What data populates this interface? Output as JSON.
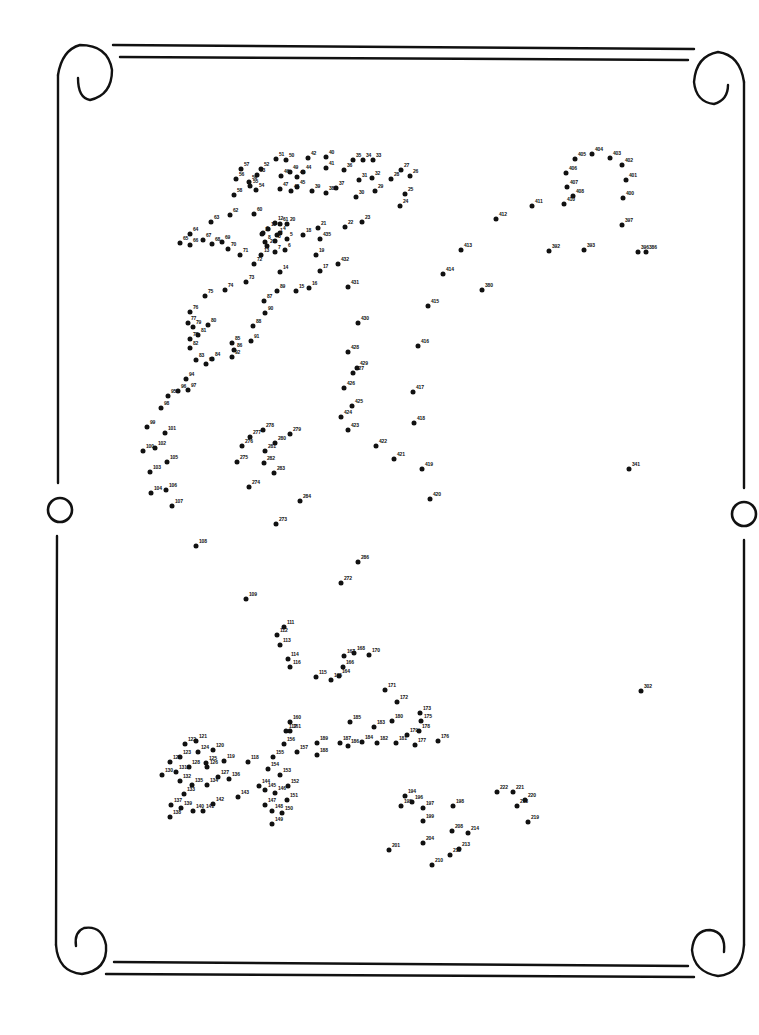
{
  "page": {
    "type": "connect-the-dots puzzle",
    "frame": "scroll border with curled corners and side rings",
    "max_number": 435,
    "ink_color": "#111111",
    "background_color": "#ffffff"
  },
  "dots": [
    {
      "n": "1",
      "x": 277,
      "y": 235
    },
    {
      "n": "2",
      "x": 267,
      "y": 246
    },
    {
      "n": "3",
      "x": 275,
      "y": 241
    },
    {
      "n": "4",
      "x": 280,
      "y": 233
    },
    {
      "n": "5",
      "x": 287,
      "y": 239
    },
    {
      "n": "6",
      "x": 285,
      "y": 250
    },
    {
      "n": "7",
      "x": 275,
      "y": 252
    },
    {
      "n": "8",
      "x": 265,
      "y": 242
    },
    {
      "n": "9",
      "x": 263,
      "y": 233
    },
    {
      "n": "10",
      "x": 262,
      "y": 234
    },
    {
      "n": "11",
      "x": 268,
      "y": 229
    },
    {
      "n": "12",
      "x": 275,
      "y": 223
    },
    {
      "n": "13",
      "x": 261,
      "y": 255
    },
    {
      "n": "14",
      "x": 280,
      "y": 272
    },
    {
      "n": "15",
      "x": 296,
      "y": 291
    },
    {
      "n": "16",
      "x": 309,
      "y": 288
    },
    {
      "n": "17",
      "x": 320,
      "y": 271
    },
    {
      "n": "18",
      "x": 303,
      "y": 235
    },
    {
      "n": "19",
      "x": 316,
      "y": 255
    },
    {
      "n": "20",
      "x": 287,
      "y": 224
    },
    {
      "n": "21",
      "x": 318,
      "y": 228
    },
    {
      "n": "22",
      "x": 345,
      "y": 227
    },
    {
      "n": "23",
      "x": 362,
      "y": 222
    },
    {
      "n": "24",
      "x": 400,
      "y": 206
    },
    {
      "n": "25",
      "x": 405,
      "y": 194
    },
    {
      "n": "26",
      "x": 410,
      "y": 176
    },
    {
      "n": "27",
      "x": 401,
      "y": 170
    },
    {
      "n": "28",
      "x": 391,
      "y": 179
    },
    {
      "n": "29",
      "x": 375,
      "y": 191
    },
    {
      "n": "30",
      "x": 356,
      "y": 197
    },
    {
      "n": "31",
      "x": 359,
      "y": 180
    },
    {
      "n": "32",
      "x": 372,
      "y": 178
    },
    {
      "n": "33",
      "x": 373,
      "y": 160
    },
    {
      "n": "34",
      "x": 363,
      "y": 160
    },
    {
      "n": "35",
      "x": 353,
      "y": 160
    },
    {
      "n": "36",
      "x": 344,
      "y": 170
    },
    {
      "n": "37",
      "x": 336,
      "y": 188
    },
    {
      "n": "38",
      "x": 326,
      "y": 193
    },
    {
      "n": "39",
      "x": 312,
      "y": 191
    },
    {
      "n": "40",
      "x": 326,
      "y": 157
    },
    {
      "n": "41",
      "x": 326,
      "y": 168
    },
    {
      "n": "42",
      "x": 308,
      "y": 158
    },
    {
      "n": "43",
      "x": 297,
      "y": 177
    },
    {
      "n": "44",
      "x": 303,
      "y": 172
    },
    {
      "n": "45",
      "x": 297,
      "y": 187
    },
    {
      "n": "46",
      "x": 281,
      "y": 176
    },
    {
      "n": "47",
      "x": 280,
      "y": 189
    },
    {
      "n": "48",
      "x": 291,
      "y": 191
    },
    {
      "n": "49",
      "x": 290,
      "y": 172
    },
    {
      "n": "50",
      "x": 286,
      "y": 160
    },
    {
      "n": "51",
      "x": 276,
      "y": 159
    },
    {
      "n": "52",
      "x": 261,
      "y": 169
    },
    {
      "n": "53",
      "x": 257,
      "y": 175
    },
    {
      "n": "54",
      "x": 256,
      "y": 190
    },
    {
      "n": "55",
      "x": 250,
      "y": 186
    },
    {
      "n": "56",
      "x": 236,
      "y": 179
    },
    {
      "n": "57",
      "x": 241,
      "y": 169
    },
    {
      "n": "58",
      "x": 234,
      "y": 195
    },
    {
      "n": "59",
      "x": 249,
      "y": 182
    },
    {
      "n": "60",
      "x": 254,
      "y": 214
    },
    {
      "n": "61",
      "x": 280,
      "y": 224
    },
    {
      "n": "62",
      "x": 230,
      "y": 215
    },
    {
      "n": "63",
      "x": 211,
      "y": 222
    },
    {
      "n": "64",
      "x": 190,
      "y": 234
    },
    {
      "n": "65",
      "x": 180,
      "y": 243
    },
    {
      "n": "66",
      "x": 190,
      "y": 245
    },
    {
      "n": "67",
      "x": 203,
      "y": 240
    },
    {
      "n": "68",
      "x": 212,
      "y": 244
    },
    {
      "n": "69",
      "x": 222,
      "y": 242
    },
    {
      "n": "70",
      "x": 228,
      "y": 249
    },
    {
      "n": "71",
      "x": 240,
      "y": 255
    },
    {
      "n": "72",
      "x": 254,
      "y": 264
    },
    {
      "n": "73",
      "x": 246,
      "y": 282
    },
    {
      "n": "74",
      "x": 225,
      "y": 290
    },
    {
      "n": "75",
      "x": 205,
      "y": 296
    },
    {
      "n": "76",
      "x": 190,
      "y": 312
    },
    {
      "n": "77",
      "x": 188,
      "y": 323
    },
    {
      "n": "78",
      "x": 190,
      "y": 339
    },
    {
      "n": "79",
      "x": 193,
      "y": 327
    },
    {
      "n": "80",
      "x": 208,
      "y": 325
    },
    {
      "n": "81",
      "x": 198,
      "y": 335
    },
    {
      "n": "82",
      "x": 190,
      "y": 348
    },
    {
      "n": "83",
      "x": 196,
      "y": 360
    },
    {
      "n": "84",
      "x": 212,
      "y": 359
    },
    {
      "n": "85",
      "x": 232,
      "y": 343
    },
    {
      "n": "86",
      "x": 234,
      "y": 350
    },
    {
      "n": "87",
      "x": 264,
      "y": 301
    },
    {
      "n": "88",
      "x": 253,
      "y": 326
    },
    {
      "n": "89",
      "x": 277,
      "y": 291
    },
    {
      "n": "90",
      "x": 265,
      "y": 313
    },
    {
      "n": "91",
      "x": 251,
      "y": 341
    },
    {
      "n": "92",
      "x": 232,
      "y": 357
    },
    {
      "n": "93",
      "x": 206,
      "y": 364
    },
    {
      "n": "94",
      "x": 186,
      "y": 379
    },
    {
      "n": "95",
      "x": 168,
      "y": 396
    },
    {
      "n": "96",
      "x": 178,
      "y": 391
    },
    {
      "n": "97",
      "x": 188,
      "y": 390
    },
    {
      "n": "98",
      "x": 161,
      "y": 408
    },
    {
      "n": "99",
      "x": 147,
      "y": 427
    },
    {
      "n": "100",
      "x": 143,
      "y": 451
    },
    {
      "n": "101",
      "x": 165,
      "y": 433
    },
    {
      "n": "102",
      "x": 155,
      "y": 448
    },
    {
      "n": "103",
      "x": 150,
      "y": 472
    },
    {
      "n": "104",
      "x": 151,
      "y": 493
    },
    {
      "n": "105",
      "x": 167,
      "y": 462
    },
    {
      "n": "106",
      "x": 166,
      "y": 490
    },
    {
      "n": "107",
      "x": 172,
      "y": 506
    },
    {
      "n": "108",
      "x": 196,
      "y": 546
    },
    {
      "n": "109",
      "x": 246,
      "y": 599
    },
    {
      "n": "111",
      "x": 284,
      "y": 627
    },
    {
      "n": "112",
      "x": 277,
      "y": 635
    },
    {
      "n": "113",
      "x": 280,
      "y": 645
    },
    {
      "n": "114",
      "x": 288,
      "y": 659
    },
    {
      "n": "115",
      "x": 316,
      "y": 677
    },
    {
      "n": "116",
      "x": 290,
      "y": 667
    },
    {
      "n": "117",
      "x": 286,
      "y": 731
    },
    {
      "n": "118",
      "x": 248,
      "y": 762
    },
    {
      "n": "119",
      "x": 224,
      "y": 761
    },
    {
      "n": "120",
      "x": 213,
      "y": 750
    },
    {
      "n": "121",
      "x": 196,
      "y": 741
    },
    {
      "n": "122",
      "x": 185,
      "y": 744
    },
    {
      "n": "123",
      "x": 180,
      "y": 757
    },
    {
      "n": "124",
      "x": 198,
      "y": 752
    },
    {
      "n": "125",
      "x": 206,
      "y": 763
    },
    {
      "n": "126",
      "x": 207,
      "y": 767
    },
    {
      "n": "127",
      "x": 218,
      "y": 777
    },
    {
      "n": "128",
      "x": 189,
      "y": 767
    },
    {
      "n": "129",
      "x": 170,
      "y": 762
    },
    {
      "n": "130",
      "x": 162,
      "y": 775
    },
    {
      "n": "131",
      "x": 176,
      "y": 772
    },
    {
      "n": "132",
      "x": 180,
      "y": 781
    },
    {
      "n": "133",
      "x": 184,
      "y": 794
    },
    {
      "n": "134",
      "x": 207,
      "y": 785
    },
    {
      "n": "135",
      "x": 192,
      "y": 785
    },
    {
      "n": "136",
      "x": 229,
      "y": 779
    },
    {
      "n": "137",
      "x": 171,
      "y": 805
    },
    {
      "n": "138",
      "x": 170,
      "y": 817
    },
    {
      "n": "139",
      "x": 181,
      "y": 808
    },
    {
      "n": "140",
      "x": 193,
      "y": 811
    },
    {
      "n": "141",
      "x": 203,
      "y": 811
    },
    {
      "n": "142",
      "x": 213,
      "y": 804
    },
    {
      "n": "143",
      "x": 238,
      "y": 797
    },
    {
      "n": "144",
      "x": 259,
      "y": 786
    },
    {
      "n": "145",
      "x": 265,
      "y": 790
    },
    {
      "n": "146",
      "x": 275,
      "y": 793
    },
    {
      "n": "147",
      "x": 265,
      "y": 805
    },
    {
      "n": "148",
      "x": 272,
      "y": 811
    },
    {
      "n": "149",
      "x": 272,
      "y": 824
    },
    {
      "n": "150",
      "x": 282,
      "y": 813
    },
    {
      "n": "151",
      "x": 287,
      "y": 800
    },
    {
      "n": "152",
      "x": 288,
      "y": 786
    },
    {
      "n": "153",
      "x": 280,
      "y": 775
    },
    {
      "n": "154",
      "x": 268,
      "y": 769
    },
    {
      "n": "155",
      "x": 273,
      "y": 757
    },
    {
      "n": "156",
      "x": 284,
      "y": 744
    },
    {
      "n": "157",
      "x": 297,
      "y": 752
    },
    {
      "n": "160",
      "x": 290,
      "y": 722
    },
    {
      "n": "161",
      "x": 290,
      "y": 731
    },
    {
      "n": "164",
      "x": 339,
      "y": 676
    },
    {
      "n": "165",
      "x": 331,
      "y": 680
    },
    {
      "n": "166",
      "x": 343,
      "y": 667
    },
    {
      "n": "167",
      "x": 344,
      "y": 656
    },
    {
      "n": "168",
      "x": 354,
      "y": 653
    },
    {
      "n": "170",
      "x": 369,
      "y": 655
    },
    {
      "n": "171",
      "x": 385,
      "y": 690
    },
    {
      "n": "172",
      "x": 397,
      "y": 702
    },
    {
      "n": "173",
      "x": 420,
      "y": 713
    },
    {
      "n": "175",
      "x": 421,
      "y": 721
    },
    {
      "n": "176",
      "x": 438,
      "y": 741
    },
    {
      "n": "177",
      "x": 415,
      "y": 745
    },
    {
      "n": "178",
      "x": 419,
      "y": 731
    },
    {
      "n": "179",
      "x": 407,
      "y": 735
    },
    {
      "n": "180",
      "x": 392,
      "y": 721
    },
    {
      "n": "181",
      "x": 396,
      "y": 743
    },
    {
      "n": "182",
      "x": 377,
      "y": 743
    },
    {
      "n": "183",
      "x": 374,
      "y": 727
    },
    {
      "n": "184",
      "x": 362,
      "y": 742
    },
    {
      "n": "185",
      "x": 350,
      "y": 722
    },
    {
      "n": "186",
      "x": 348,
      "y": 746
    },
    {
      "n": "187",
      "x": 340,
      "y": 743
    },
    {
      "n": "188",
      "x": 317,
      "y": 755
    },
    {
      "n": "189",
      "x": 317,
      "y": 743
    },
    {
      "n": "194",
      "x": 405,
      "y": 796
    },
    {
      "n": "195",
      "x": 401,
      "y": 806
    },
    {
      "n": "196",
      "x": 412,
      "y": 802
    },
    {
      "n": "197",
      "x": 423,
      "y": 808
    },
    {
      "n": "198",
      "x": 453,
      "y": 806
    },
    {
      "n": "199",
      "x": 423,
      "y": 821
    },
    {
      "n": "201",
      "x": 389,
      "y": 850
    },
    {
      "n": "204",
      "x": 423,
      "y": 843
    },
    {
      "n": "208",
      "x": 452,
      "y": 831
    },
    {
      "n": "210",
      "x": 432,
      "y": 865
    },
    {
      "n": "212",
      "x": 450,
      "y": 855
    },
    {
      "n": "213",
      "x": 459,
      "y": 849
    },
    {
      "n": "214",
      "x": 468,
      "y": 833
    },
    {
      "n": "218",
      "x": 517,
      "y": 806
    },
    {
      "n": "219",
      "x": 528,
      "y": 822
    },
    {
      "n": "220",
      "x": 525,
      "y": 800
    },
    {
      "n": "221",
      "x": 513,
      "y": 792
    },
    {
      "n": "222",
      "x": 497,
      "y": 792
    },
    {
      "n": "272",
      "x": 341,
      "y": 583
    },
    {
      "n": "273",
      "x": 276,
      "y": 524
    },
    {
      "n": "274",
      "x": 249,
      "y": 487
    },
    {
      "n": "275",
      "x": 237,
      "y": 462
    },
    {
      "n": "276",
      "x": 242,
      "y": 446
    },
    {
      "n": "277",
      "x": 250,
      "y": 437
    },
    {
      "n": "278",
      "x": 263,
      "y": 430
    },
    {
      "n": "279",
      "x": 290,
      "y": 434
    },
    {
      "n": "280",
      "x": 275,
      "y": 443
    },
    {
      "n": "281",
      "x": 265,
      "y": 451
    },
    {
      "n": "282",
      "x": 264,
      "y": 463
    },
    {
      "n": "283",
      "x": 274,
      "y": 473
    },
    {
      "n": "284",
      "x": 300,
      "y": 501
    },
    {
      "n": "286",
      "x": 358,
      "y": 562
    },
    {
      "n": "302",
      "x": 641,
      "y": 691
    },
    {
      "n": "341",
      "x": 629,
      "y": 469
    },
    {
      "n": "380",
      "x": 482,
      "y": 290
    },
    {
      "n": "386",
      "x": 646,
      "y": 252
    },
    {
      "n": "392",
      "x": 549,
      "y": 251
    },
    {
      "n": "393",
      "x": 584,
      "y": 250
    },
    {
      "n": "396",
      "x": 638,
      "y": 252
    },
    {
      "n": "397",
      "x": 622,
      "y": 225
    },
    {
      "n": "400",
      "x": 623,
      "y": 198
    },
    {
      "n": "401",
      "x": 626,
      "y": 180
    },
    {
      "n": "402",
      "x": 622,
      "y": 165
    },
    {
      "n": "403",
      "x": 610,
      "y": 158
    },
    {
      "n": "404",
      "x": 592,
      "y": 154
    },
    {
      "n": "405",
      "x": 575,
      "y": 159
    },
    {
      "n": "406",
      "x": 566,
      "y": 173
    },
    {
      "n": "407",
      "x": 567,
      "y": 187
    },
    {
      "n": "408",
      "x": 573,
      "y": 196
    },
    {
      "n": "410",
      "x": 564,
      "y": 204
    },
    {
      "n": "411",
      "x": 532,
      "y": 206
    },
    {
      "n": "412",
      "x": 496,
      "y": 219
    },
    {
      "n": "413",
      "x": 461,
      "y": 250
    },
    {
      "n": "414",
      "x": 443,
      "y": 274
    },
    {
      "n": "415",
      "x": 428,
      "y": 306
    },
    {
      "n": "416",
      "x": 418,
      "y": 346
    },
    {
      "n": "417",
      "x": 413,
      "y": 392
    },
    {
      "n": "418",
      "x": 414,
      "y": 423
    },
    {
      "n": "419",
      "x": 422,
      "y": 469
    },
    {
      "n": "420",
      "x": 430,
      "y": 499
    },
    {
      "n": "421",
      "x": 394,
      "y": 459
    },
    {
      "n": "422",
      "x": 376,
      "y": 446
    },
    {
      "n": "423",
      "x": 348,
      "y": 430
    },
    {
      "n": "424",
      "x": 341,
      "y": 417
    },
    {
      "n": "425",
      "x": 352,
      "y": 406
    },
    {
      "n": "426",
      "x": 344,
      "y": 388
    },
    {
      "n": "427",
      "x": 353,
      "y": 373
    },
    {
      "n": "428",
      "x": 348,
      "y": 352
    },
    {
      "n": "429",
      "x": 357,
      "y": 368
    },
    {
      "n": "430",
      "x": 358,
      "y": 323
    },
    {
      "n": "431",
      "x": 348,
      "y": 287
    },
    {
      "n": "432",
      "x": 338,
      "y": 264
    },
    {
      "n": "435",
      "x": 320,
      "y": 239
    }
  ],
  "frame_elements": [
    "top-double-rule",
    "bottom-double-rule",
    "left-rail",
    "right-rail",
    "top-left-curl",
    "top-right-curl",
    "bottom-left-curl",
    "bottom-right-curl",
    "left-ring",
    "right-ring"
  ]
}
